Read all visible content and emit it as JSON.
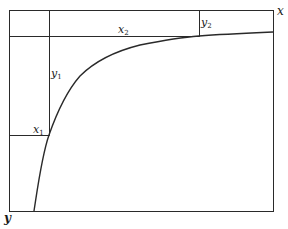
{
  "diagram": {
    "axes": {
      "x_label": "x",
      "y_label": "y"
    },
    "labels": {
      "x1": {
        "base": "x",
        "sub": "1"
      },
      "x2": {
        "base": "x",
        "sub": "2"
      },
      "y1": {
        "base": "y",
        "sub": "1"
      },
      "y2": {
        "base": "y",
        "sub": "2"
      }
    },
    "colors": {
      "line": "#2a2a2a",
      "background": "#ffffff"
    },
    "curve": {
      "description": "Concave saturating curve rising from bottom-left toward the top-right, approaching the top edge asymptotically",
      "points": [
        [
          34,
          211
        ],
        [
          40,
          170
        ],
        [
          49,
          135
        ],
        [
          60,
          108
        ],
        [
          80,
          72
        ],
        [
          100,
          60
        ],
        [
          140,
          46
        ],
        [
          199,
          36
        ],
        [
          273,
          32
        ]
      ]
    }
  }
}
